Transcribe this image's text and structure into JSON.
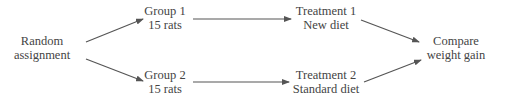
{
  "diagram": {
    "type": "experimental-design-flowchart",
    "nodes": {
      "random": {
        "line1": "Random",
        "line2": "assignment"
      },
      "group1": {
        "line1": "Group 1",
        "line2": "15 rats"
      },
      "group2": {
        "line1": "Group 2",
        "line2": "15 rats"
      },
      "treatment1": {
        "line1": "Treatment 1",
        "line2": "New diet"
      },
      "treatment2": {
        "line1": "Treatment 2",
        "line2": "Standard diet"
      },
      "compare": {
        "line1": "Compare",
        "line2": "weight gain"
      }
    },
    "edges": [
      {
        "from": "random",
        "to": "group1"
      },
      {
        "from": "random",
        "to": "group2"
      },
      {
        "from": "group1",
        "to": "treatment1"
      },
      {
        "from": "group2",
        "to": "treatment2"
      },
      {
        "from": "treatment1",
        "to": "compare"
      },
      {
        "from": "treatment2",
        "to": "compare"
      }
    ],
    "colors": {
      "line": "#555555",
      "text": "#444444",
      "background": "#ffffff"
    }
  }
}
